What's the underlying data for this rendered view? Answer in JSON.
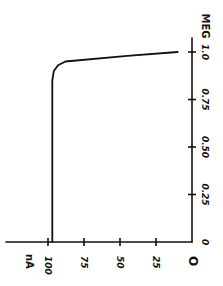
{
  "chart_data": {
    "type": "line",
    "title": "",
    "orientation": "rotated 90° counter-clockwise (hand-drawn)",
    "xlabel": "MEG",
    "ylabel": "nA",
    "xlim": [
      0,
      1.0
    ],
    "ylim": [
      0,
      100
    ],
    "x_ticks": [
      "0",
      "0.25",
      "0.50",
      "0.75",
      "1.0"
    ],
    "y_ticks": [
      "0",
      "25",
      "50",
      "75",
      "100"
    ],
    "y_origin_label": "O",
    "grid": false,
    "legend": null,
    "series": [
      {
        "name": "current",
        "x": [
          0,
          0.25,
          0.5,
          0.75,
          0.85,
          0.9,
          0.93,
          0.95,
          0.98,
          1.0
        ],
        "y": [
          97,
          97,
          97,
          97,
          97,
          96,
          93,
          88,
          45,
          10
        ]
      }
    ]
  }
}
